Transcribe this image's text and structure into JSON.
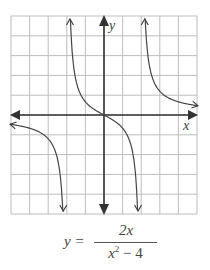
{
  "chart_data": {
    "type": "line",
    "title": "",
    "function": "y = 2x/(x^2 - 4)",
    "xlabel": "x",
    "ylabel": "y",
    "xlim": [
      -5,
      5
    ],
    "ylim": [
      -5,
      5
    ],
    "grid": true,
    "vertical_asymptotes": [
      -2,
      2
    ],
    "horizontal_asymptote": 0,
    "series": [
      {
        "name": "left branch",
        "x": [
          -5,
          -4,
          -3,
          -2.5,
          -2.2
        ],
        "values": [
          -0.48,
          -0.67,
          -1.2,
          -2.22,
          -5.24
        ]
      },
      {
        "name": "middle branch",
        "x": [
          -1.8,
          -1,
          0,
          1,
          1.8
        ],
        "values": [
          4.74,
          0.67,
          0,
          -0.67,
          -4.74
        ]
      },
      {
        "name": "right branch",
        "x": [
          2.2,
          2.5,
          3,
          4,
          5
        ],
        "values": [
          5.24,
          2.22,
          1.2,
          0.67,
          0.48
        ]
      }
    ]
  },
  "axes": {
    "x_label": "x",
    "y_label": "y"
  },
  "formula": {
    "lhs": "y =",
    "numerator": "2x",
    "denominator_base": "x",
    "denominator_exp": "2",
    "denominator_rest": " − 4"
  },
  "colors": {
    "grid": "#bdbdbd",
    "axis": "#333333",
    "curve": "#444444"
  }
}
